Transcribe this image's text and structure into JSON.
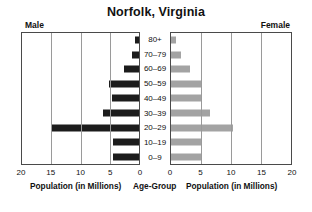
{
  "chart_data": {
    "type": "bar",
    "title": "Norfolk, Virginia",
    "subtype": "population-pyramid",
    "categories": [
      "80+",
      "70–79",
      "60–69",
      "50–59",
      "40–49",
      "30–39",
      "20–29",
      "10–19",
      "0–9"
    ],
    "series": [
      {
        "name": "Male",
        "color": "#1c1c1c",
        "values": [
          0.7,
          1.2,
          2.5,
          5.2,
          4.6,
          6.2,
          15.0,
          4.5,
          4.4
        ]
      },
      {
        "name": "Female",
        "color": "#a3a3a3",
        "values": [
          0.8,
          1.7,
          3.2,
          5.2,
          5.0,
          6.5,
          10.4,
          5.1,
          5.2
        ]
      }
    ],
    "xlabel": "Population (in Millions)",
    "ylabel": "Age-Group",
    "xlim": [
      0,
      20
    ],
    "left_ticks": [
      "20",
      "15",
      "10",
      "5",
      "0"
    ],
    "right_ticks": [
      "0",
      "5",
      "10",
      "15",
      "20"
    ],
    "grid": true,
    "legend": "none",
    "left_axis_direction": "reversed"
  },
  "title": "Norfolk, Virginia",
  "captions": {
    "male": "Male",
    "female": "Female",
    "left_axis": "Population (in Millions)",
    "center_axis": "Age-Group",
    "right_axis": "Population (in Millions)"
  }
}
